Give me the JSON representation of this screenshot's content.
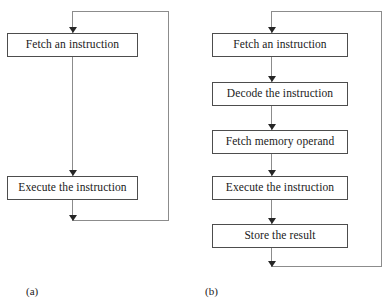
{
  "figure": {
    "width": 392,
    "height": 307,
    "background": "#ffffff",
    "box_border_color": "#4d4d4d",
    "connector_color": "#8c8c8c",
    "arrow_color": "#262626",
    "text_color": "#1a1a1a"
  },
  "panel_a": {
    "caption": "(a)",
    "boxes": [
      {
        "label": "Fetch an instruction"
      },
      {
        "label": "Execute the instruction"
      }
    ]
  },
  "panel_b": {
    "caption": "(b)",
    "boxes": [
      {
        "label": "Fetch an instruction"
      },
      {
        "label": "Decode the instruction"
      },
      {
        "label": "Fetch memory operand"
      },
      {
        "label": "Execute the instruction"
      },
      {
        "label": "Store the result"
      }
    ]
  }
}
